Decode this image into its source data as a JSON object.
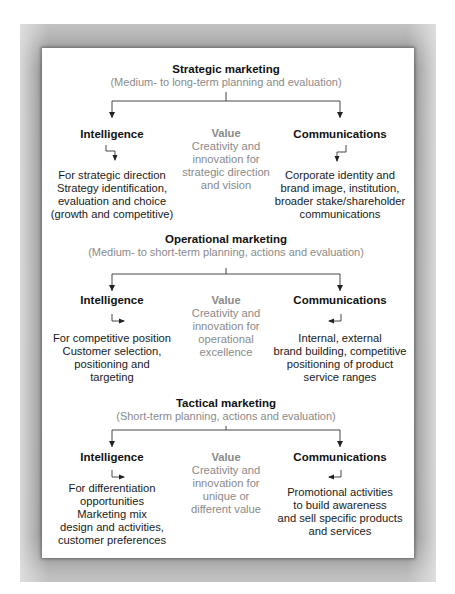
{
  "sections": [
    {
      "title": "Strategic marketing",
      "subtitle": "(Medium- to long-term planning and evaluation)",
      "intelligence": {
        "heading": "Intelligence",
        "lines": [
          "For strategic direction",
          "Strategy identification,",
          "evaluation and choice",
          "(growth and competitive)"
        ]
      },
      "value": {
        "heading": "Value",
        "lines": [
          "Creativity and",
          "innovation for",
          "strategic direction",
          "and vision"
        ]
      },
      "communications": {
        "heading": "Communications",
        "lines": [
          "Corporate identity and",
          "brand image, institution,",
          "broader stake/shareholder",
          "communications"
        ]
      }
    },
    {
      "title": "Operational marketing",
      "subtitle": "(Medium- to short-term planning, actions and evaluation)",
      "intelligence": {
        "heading": "Intelligence",
        "lines": [
          "For competitive position",
          "Customer selection,",
          "positioning and",
          "targeting"
        ]
      },
      "value": {
        "heading": "Value",
        "lines": [
          "Creativity and",
          "innovation for",
          "operational",
          "excellence"
        ]
      },
      "communications": {
        "heading": "Communications",
        "lines": [
          "Internal, external",
          "brand building, competitive",
          "positioning of product",
          "service ranges"
        ]
      }
    },
    {
      "title": "Tactical marketing",
      "subtitle": "(Short-term planning, actions and evaluation)",
      "intelligence": {
        "heading": "Intelligence",
        "lines": [
          "For differentiation",
          "opportunities",
          "Marketing mix",
          "design and activities,",
          "customer preferences"
        ]
      },
      "value": {
        "heading": "Value",
        "lines": [
          "Creativity and",
          "innovation for",
          "unique or",
          "different value"
        ]
      },
      "communications": {
        "heading": "Communications",
        "lines": [
          "Promotional activities",
          "to build awareness",
          "and sell specific products",
          "and services"
        ]
      }
    }
  ],
  "colors": {
    "frame": "#8c8c8c",
    "panel": "#ffffff",
    "text": "#1a1a1a",
    "muted": "#8a8a8a"
  }
}
